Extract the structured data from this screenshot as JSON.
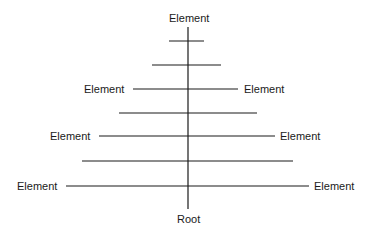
{
  "diagram": {
    "top_label": "Element",
    "root_label": "Root",
    "left_labels": [
      "Element",
      "Element",
      "Element"
    ],
    "right_labels": [
      "Element",
      "Element",
      "Element"
    ],
    "line_color": "#1a1a1a",
    "trunk": {
      "x": 188,
      "y1": 27,
      "y2": 209
    },
    "branches": [
      {
        "y": 41,
        "x1": 169,
        "x2": 204,
        "labeled": false
      },
      {
        "y": 65,
        "x1": 152,
        "x2": 221,
        "labeled": false
      },
      {
        "y": 89,
        "x1": 133,
        "x2": 238,
        "labeled": true
      },
      {
        "y": 113,
        "x1": 119,
        "x2": 257,
        "labeled": false
      },
      {
        "y": 136,
        "x1": 99,
        "x2": 275,
        "labeled": true
      },
      {
        "y": 161,
        "x1": 82,
        "x2": 293,
        "labeled": false
      },
      {
        "y": 186,
        "x1": 66,
        "x2": 309,
        "labeled": true
      }
    ]
  }
}
